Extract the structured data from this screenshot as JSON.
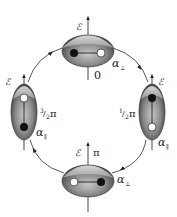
{
  "diagram": {
    "type": "cycle",
    "field_label": "ℰ",
    "states": [
      {
        "id": "top",
        "phase": "0",
        "polarizability": "α",
        "pol_sub": "⊥",
        "orientation": "horizontal",
        "left_dot": "filled",
        "right_dot": "open"
      },
      {
        "id": "right",
        "phase_num": "1",
        "phase_den": "2",
        "phase_sym": "π",
        "polarizability": "α",
        "pol_sub": "∥",
        "orientation": "vertical",
        "top_dot": "filled",
        "bottom_dot": "open"
      },
      {
        "id": "bottom",
        "phase": "π",
        "polarizability": "α",
        "pol_sub": "⊥",
        "orientation": "horizontal",
        "left_dot": "open",
        "right_dot": "filled"
      },
      {
        "id": "left",
        "phase_num": "3",
        "phase_den": "2",
        "phase_sym": "π",
        "polarizability": "α",
        "pol_sub": "∥",
        "orientation": "vertical",
        "top_dot": "open",
        "bottom_dot": "filled"
      }
    ],
    "arrow_direction": "clockwise",
    "colors": {
      "body_dark": "#3a3a3a",
      "body_mid": "#8a8a8a",
      "body_light": "#d0d0d0",
      "cap": "#b8b8b8",
      "line": "#333333"
    }
  }
}
